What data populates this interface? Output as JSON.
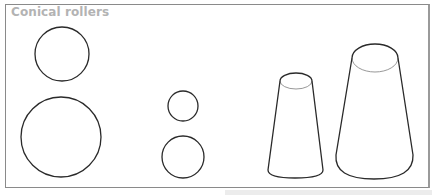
{
  "figure": {
    "title": "Conical rollers",
    "colors": {
      "title_text": "#b3b3b3",
      "border": "#8a8a8a",
      "stroke": "#2a2a2a",
      "inner_edge": "#8c8c8c",
      "background": "#ffffff"
    },
    "shapes": [
      {
        "type": "circle",
        "label": "small-circle-top-left",
        "cx": 62,
        "cy": 54,
        "r": 27
      },
      {
        "type": "circle",
        "label": "large-circle-bottom-left",
        "cx": 61,
        "cy": 137,
        "r": 40
      },
      {
        "type": "circle",
        "label": "small-circle-top-middle",
        "cx": 183,
        "cy": 106,
        "r": 15
      },
      {
        "type": "circle",
        "label": "small-circle-bottom-middle",
        "cx": 183,
        "cy": 157,
        "r": 21
      },
      {
        "type": "cone",
        "label": "small-conical-roller",
        "top": {
          "cx": 296,
          "cy": 81,
          "rx": 16,
          "ry": 8
        },
        "bottom": {
          "left_x": 268,
          "right_x": 323,
          "y": 170,
          "arc_bottom_y": 178
        }
      },
      {
        "type": "cone",
        "label": "large-conical-roller",
        "top": {
          "cx": 375,
          "cy": 58,
          "rx": 23,
          "ry": 14
        },
        "bottom": {
          "left_x": 336,
          "right_x": 413,
          "y": 155,
          "arc_bottom_y": 179
        }
      }
    ]
  }
}
